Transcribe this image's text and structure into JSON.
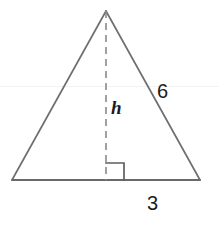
{
  "figure": {
    "kind": "geometry-diagram",
    "background_color": "#ffffff",
    "stroke_color": "#6f6f6f",
    "stroke_color_dark": "#5a5a5a",
    "text_color": "#1b1b1b",
    "stroke_width": 1.6,
    "canvas": {
      "width": 219,
      "height": 227
    },
    "vertices": {
      "apex": {
        "x": 106,
        "y": 11
      },
      "base_left": {
        "x": 12,
        "y": 180
      },
      "base_right": {
        "x": 200,
        "y": 180
      },
      "foot": {
        "x": 106,
        "y": 180
      }
    },
    "altitude": {
      "from": {
        "x": 106,
        "y": 11
      },
      "to": {
        "x": 106,
        "y": 180
      },
      "style": "dashed",
      "dash_pattern": "7 5"
    },
    "right_angle_marker": {
      "x": 106,
      "y": 163,
      "size": 18,
      "orientation": "lower-left-open"
    },
    "labels": {
      "altitude": "h",
      "slant_side": "6",
      "half_base": "3"
    }
  }
}
